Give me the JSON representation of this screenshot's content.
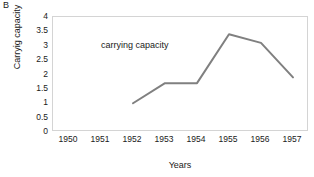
{
  "panel": {
    "label": "B"
  },
  "chart_data": {
    "type": "line",
    "title": "",
    "xlabel": "Years",
    "ylabel": "Carryig capacity",
    "x": [
      1950,
      1951,
      1952,
      1953,
      1954,
      1955,
      1956,
      1957
    ],
    "categories": [
      "1950",
      "1951",
      "1952",
      "1953",
      "1954",
      "1955",
      "1956",
      "1957"
    ],
    "series": [
      {
        "name": "carrying capacity",
        "x": [
          1952,
          1953,
          1954,
          1955,
          1956,
          1957
        ],
        "values": [
          1.0,
          1.7,
          1.7,
          3.4,
          3.1,
          1.9
        ],
        "color": "#808080"
      }
    ],
    "annotations": [
      {
        "text": "carrying capacity",
        "x": 1951.0,
        "y": 3.0
      }
    ],
    "xlim": [
      1949.5,
      1957.5
    ],
    "ylim": [
      0,
      4
    ],
    "yticks": [
      0,
      0.5,
      1,
      1.5,
      2,
      2.5,
      3,
      3.5,
      4
    ],
    "ytick_labels": [
      "0",
      "0.5",
      "1",
      "1.5",
      "2",
      "2.5",
      "3",
      "3.5",
      "4"
    ],
    "grid": false,
    "legend": "none",
    "line_color": "#808080",
    "line_width": 2,
    "markers": "none",
    "plot_border_color": "#d4d4d4"
  }
}
